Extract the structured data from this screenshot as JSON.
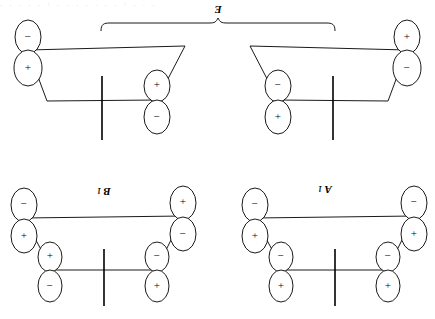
{
  "figure": {
    "type": "orbital-symmetry-diagram",
    "orientation": "rotated-180",
    "background_color": "#ffffff",
    "line_color": "#000000",
    "artifact_text": ".  .   . .  .  :  .   .   .    . .   .  . :  . .  .",
    "panels": [
      {
        "id": "e-left",
        "symmetry_label": "E",
        "label_position": "top-center-shared",
        "lobes": [
          {
            "name": "upper-left-p-orbital-top-lobe",
            "sign": "−"
          },
          {
            "name": "upper-left-p-orbital-bottom-lobe",
            "sign": "+"
          },
          {
            "name": "lower-right-p-orbital-top-lobe",
            "sign": "+"
          },
          {
            "name": "lower-right-p-orbital-bottom-lobe",
            "sign": "−"
          }
        ]
      },
      {
        "id": "e-right",
        "symmetry_label": "E",
        "label_position": "top-center-shared",
        "lobes": [
          {
            "name": "upper-right-p-orbital-top-lobe",
            "sign": "+"
          },
          {
            "name": "upper-right-p-orbital-bottom-lobe",
            "sign": "−"
          },
          {
            "name": "lower-left-p-orbital-top-lobe",
            "sign": "−"
          },
          {
            "name": "lower-left-p-orbital-bottom-lobe",
            "sign": "+"
          }
        ]
      },
      {
        "id": "b1",
        "symmetry_label": "B",
        "symmetry_subscript": "1",
        "label_position": "panel-top-center",
        "lobes": [
          {
            "name": "upper-left-p-orbital-top-lobe",
            "sign": "−"
          },
          {
            "name": "upper-left-p-orbital-bottom-lobe",
            "sign": "+"
          },
          {
            "name": "lower-left-p-orbital-top-lobe",
            "sign": "+"
          },
          {
            "name": "lower-left-p-orbital-bottom-lobe",
            "sign": "−"
          },
          {
            "name": "upper-right-p-orbital-top-lobe",
            "sign": "+"
          },
          {
            "name": "upper-right-p-orbital-bottom-lobe",
            "sign": "−"
          },
          {
            "name": "lower-right-p-orbital-top-lobe",
            "sign": "−"
          },
          {
            "name": "lower-right-p-orbital-bottom-lobe",
            "sign": "+"
          }
        ]
      },
      {
        "id": "a1",
        "symmetry_label": "A",
        "symmetry_subscript": "1",
        "label_position": "panel-top-center",
        "lobes": [
          {
            "name": "upper-left-p-orbital-top-lobe",
            "sign": "−"
          },
          {
            "name": "upper-left-p-orbital-bottom-lobe",
            "sign": "+"
          },
          {
            "name": "lower-left-p-orbital-top-lobe",
            "sign": "−"
          },
          {
            "name": "lower-left-p-orbital-bottom-lobe",
            "sign": "+"
          },
          {
            "name": "upper-right-p-orbital-top-lobe",
            "sign": "−"
          },
          {
            "name": "upper-right-p-orbital-bottom-lobe",
            "sign": "+"
          },
          {
            "name": "lower-right-p-orbital-top-lobe",
            "sign": "−"
          },
          {
            "name": "lower-right-p-orbital-bottom-lobe",
            "sign": "+"
          }
        ]
      }
    ],
    "signs": {
      "plus": "+",
      "minus": "−"
    },
    "symbols": {
      "e": "E",
      "b": "B",
      "a": "A",
      "one": "1"
    }
  }
}
